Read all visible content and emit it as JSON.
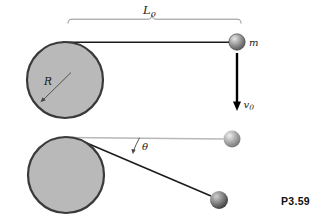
{
  "figure": {
    "caption": "P3.59",
    "labels": {
      "length_base": "L",
      "length_sub": "0",
      "mass": "m",
      "velocity_base": "v",
      "velocity_sub": "0",
      "radius": "R",
      "angle": "θ"
    },
    "colors": {
      "background": "#ffffff",
      "cylinder_fill": "#b9b9b9",
      "cylinder_stroke": "#3a3a3a",
      "string": "#1c1c1c",
      "initial_string": "#b7b7b7",
      "brace": "#8f8f8f",
      "arrow": "#000000",
      "thin_arrow": "#444444",
      "ball": {
        "highlight": "#e8e8e8",
        "mid": "#9f9f9f",
        "edge": "#4e4e4e"
      },
      "ball_faint": {
        "highlight": "#efefef",
        "mid": "#b2b2b2",
        "edge": "#6e6e6e"
      },
      "ball_dark": {
        "highlight": "#cfcfcf",
        "mid": "#8a8a8a",
        "edge": "#333333"
      }
    }
  }
}
